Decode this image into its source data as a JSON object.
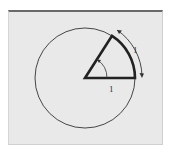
{
  "diagram": {
    "title": "",
    "labels": {
      "radius_label": "1",
      "arc_label": "1"
    },
    "colors": {
      "background": "#e9e9e9",
      "stroke": "#2a2a2a",
      "frame_top": "#6a6a6a"
    },
    "geometry": {
      "center": [
        85,
        78
      ],
      "radius": 50,
      "sector_angle_deg": 57.3
    }
  }
}
